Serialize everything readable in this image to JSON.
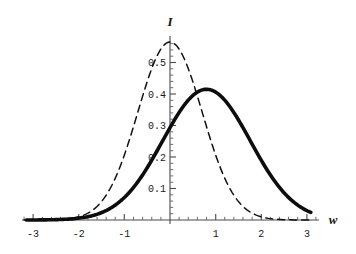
{
  "chart_data": {
    "type": "line",
    "title": "",
    "xlabel": "w",
    "ylabel": "I",
    "xlim": [
      -3.2,
      3.2
    ],
    "ylim": [
      0,
      0.58
    ],
    "grid": false,
    "legend": "none",
    "x_ticks": [
      -3,
      -2,
      -1,
      1,
      2,
      3
    ],
    "x_tick_labels": [
      "-3",
      "-2",
      "-1",
      "1",
      "2",
      "3"
    ],
    "x_minor_tick_step": 0.2,
    "y_ticks": [
      0.1,
      0.2,
      0.3,
      0.4,
      0.5
    ],
    "y_tick_labels": [
      "0.1",
      "0.2",
      "0.3",
      "0.4",
      "0.5"
    ],
    "y_minor_tick_step": 0.02,
    "series": [
      {
        "name": "dashed-gaussian",
        "style": "dashed",
        "color": "#111111",
        "peak_x": 0.0,
        "peak_y": 0.565,
        "sigma": 0.705,
        "x": [
          -3.2,
          -3.0,
          -2.8,
          -2.6,
          -2.4,
          -2.2,
          -2.0,
          -1.8,
          -1.6,
          -1.4,
          -1.2,
          -1.0,
          -0.8,
          -0.6,
          -0.4,
          -0.2,
          0.0,
          0.2,
          0.4,
          0.6,
          0.8,
          1.0,
          1.2,
          1.4,
          1.6,
          1.8,
          2.0,
          2.2,
          2.4,
          2.6,
          2.8,
          3.0,
          3.2
        ],
        "values": [
          0.0001,
          0.0005,
          0.0014,
          0.0037,
          0.0089,
          0.0198,
          0.0401,
          0.0745,
          0.1266,
          0.1971,
          0.2806,
          0.3659,
          0.4374,
          0.4794,
          0.5281,
          0.5528,
          0.565,
          0.5528,
          0.5281,
          0.4794,
          0.4374,
          0.3659,
          0.2806,
          0.1971,
          0.1266,
          0.0745,
          0.0401,
          0.0198,
          0.0089,
          0.0037,
          0.0014,
          0.0005,
          0.0001
        ]
      },
      {
        "name": "solid-gaussian",
        "style": "solid-bold",
        "color": "#0d0d0d",
        "peak_x": 0.8,
        "peak_y": 0.415,
        "sigma": 0.96,
        "x": [
          -3.2,
          -3.0,
          -2.8,
          -2.6,
          -2.4,
          -2.2,
          -2.0,
          -1.8,
          -1.6,
          -1.4,
          -1.2,
          -1.0,
          -0.8,
          -0.6,
          -0.4,
          -0.2,
          0.0,
          0.2,
          0.4,
          0.6,
          0.8,
          1.0,
          1.2,
          1.4,
          1.6,
          1.8,
          2.0,
          2.2,
          2.4,
          2.6,
          2.8,
          3.0,
          3.2
        ],
        "values": [
          0.0005,
          0.0011,
          0.0023,
          0.0045,
          0.0084,
          0.0149,
          0.0253,
          0.041,
          0.0636,
          0.0946,
          0.135,
          0.1848,
          0.2428,
          0.3062,
          0.3645,
          0.3995,
          0.406,
          0.4131,
          0.415,
          0.415,
          0.415,
          0.406,
          0.3645,
          0.3062,
          0.2428,
          0.1848,
          0.135,
          0.0946,
          0.0636,
          0.041,
          0.0253,
          0.0149,
          0.0084
        ]
      }
    ]
  },
  "axes": {
    "y_axis_label": "I",
    "x_axis_label": "w"
  },
  "ticks": {
    "x": {
      "t_m3": "-3",
      "t_m2": "-2",
      "t_m1": "-1",
      "t_p1": "1",
      "t_p2": "2",
      "t_p3": "3"
    },
    "y": {
      "t_01": "0.1",
      "t_02": "0.2",
      "t_03": "0.3",
      "t_04": "0.4",
      "t_05": "0.5"
    }
  }
}
